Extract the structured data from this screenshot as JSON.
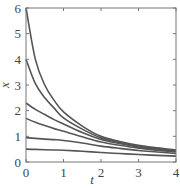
{
  "header": {
    "cut_off_text": "…"
  },
  "chart_data": {
    "type": "line",
    "title": "",
    "xlabel": "t",
    "ylabel": "x",
    "xlim": [
      0,
      4
    ],
    "ylim": [
      0,
      6
    ],
    "xticks": [
      0,
      1,
      2,
      3,
      4
    ],
    "yticks": [
      0,
      1,
      2,
      3,
      4,
      5,
      6
    ],
    "grid": false,
    "legend": null,
    "line_color": "#555555",
    "x": [
      0,
      0.25,
      0.5,
      0.75,
      1,
      1.5,
      2,
      2.5,
      3,
      3.5,
      4
    ],
    "series": [
      {
        "name": "x0=6",
        "values": [
          6.0,
          4.0,
          3.0,
          2.4,
          1.95,
          1.4,
          1.0,
          0.8,
          0.65,
          0.55,
          0.47
        ]
      },
      {
        "name": "x0=4",
        "values": [
          4.0,
          3.05,
          2.5,
          2.1,
          1.72,
          1.28,
          0.94,
          0.76,
          0.62,
          0.52,
          0.44
        ]
      },
      {
        "name": "x0=2.3",
        "values": [
          2.3,
          2.05,
          1.85,
          1.65,
          1.48,
          1.15,
          0.88,
          0.72,
          0.59,
          0.5,
          0.42
        ]
      },
      {
        "name": "x0=1.7",
        "values": [
          1.7,
          1.55,
          1.42,
          1.3,
          1.2,
          0.98,
          0.78,
          0.65,
          0.54,
          0.46,
          0.39
        ]
      },
      {
        "name": "x0=0.95",
        "values": [
          0.95,
          0.92,
          0.89,
          0.87,
          0.84,
          0.74,
          0.62,
          0.53,
          0.45,
          0.39,
          0.33
        ]
      },
      {
        "name": "x0=0.5",
        "values": [
          0.5,
          0.49,
          0.48,
          0.47,
          0.46,
          0.42,
          0.37,
          0.33,
          0.29,
          0.26,
          0.23
        ]
      }
    ]
  }
}
